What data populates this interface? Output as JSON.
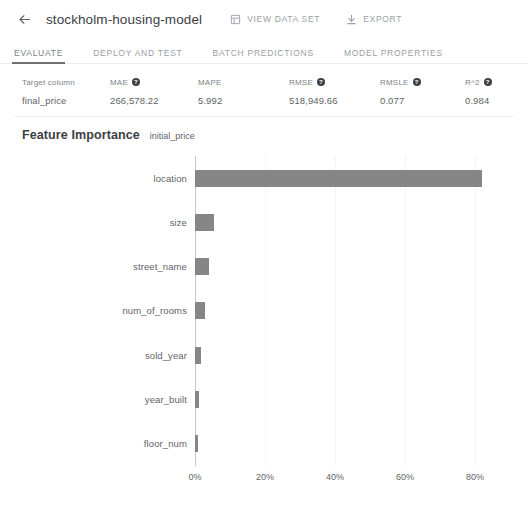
{
  "header": {
    "back_icon": "arrow-left-icon",
    "title": "stockholm-housing-model",
    "actions": [
      {
        "label": "VIEW DATA SET",
        "icon": "table-icon"
      },
      {
        "label": "EXPORT",
        "icon": "download-icon"
      }
    ]
  },
  "tabs": [
    {
      "label": "EVALUATE",
      "active": true
    },
    {
      "label": "DEPLOY AND TEST",
      "active": false
    },
    {
      "label": "BATCH PREDICTIONS",
      "active": false
    },
    {
      "label": "MODEL PROPERTIES",
      "active": false
    }
  ],
  "metrics": [
    {
      "name": "Target column",
      "value": "final_price",
      "help": false,
      "left": 0,
      "width": 88
    },
    {
      "name": "MAE",
      "value": "266,578.22",
      "help": true,
      "left": 88,
      "width": 88
    },
    {
      "name": "MAPE",
      "value": "5.992",
      "help": false,
      "left": 176,
      "width": 91
    },
    {
      "name": "RMSE",
      "value": "518,949.66",
      "help": true,
      "left": 267,
      "width": 91
    },
    {
      "name": "RMSLE",
      "value": "0.077",
      "help": true,
      "left": 358,
      "width": 85
    },
    {
      "name": "R^2",
      "value": "0.984",
      "help": true,
      "left": 443,
      "width": 60
    }
  ],
  "feature_importance": {
    "title": "Feature Importance",
    "subtitle": "initial_price"
  },
  "chart_data": {
    "type": "bar",
    "orientation": "horizontal",
    "title": "Feature Importance",
    "subtitle": "initial_price",
    "xlabel": "",
    "ylabel": "",
    "xlim": [
      0,
      90
    ],
    "xticks": [
      0,
      20,
      40,
      60,
      80
    ],
    "xtick_labels": [
      "0%",
      "20%",
      "40%",
      "60%",
      "80%"
    ],
    "grid": true,
    "legend": null,
    "bar_color": "#868686",
    "categories": [
      "location",
      "size",
      "street_name",
      "num_of_rooms",
      "sold_year",
      "year_built",
      "floor_num"
    ],
    "values": [
      82,
      5.5,
      4,
      2.8,
      1.8,
      1.2,
      0.8
    ]
  }
}
